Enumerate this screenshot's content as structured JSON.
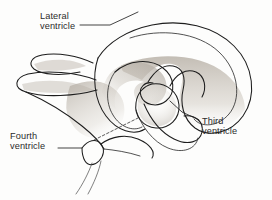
{
  "figure": {
    "background_color": "#fdfdfc",
    "ink_color": "#1d1d1d",
    "shading_color": "#9a948c",
    "labels": [
      {
        "id": "lateral-ventricle",
        "line1": "Lateral",
        "line2": "ventricle",
        "text_x": 40,
        "text_y": 19,
        "leader": "M 80 25 L 110 25 L 138 12"
      },
      {
        "id": "third-ventricle",
        "line1": "Third",
        "line2": "ventricle",
        "text_x": 202,
        "text_y": 124,
        "leader": "M 199 120 L 182 112 L 170 101"
      },
      {
        "id": "fourth-ventricle",
        "line1": "Fourth",
        "line2": "ventricle",
        "text_x": 10,
        "text_y": 139,
        "leader": "M 58 148 L 82 148"
      }
    ],
    "structures": [
      {
        "id": "lateral-ventricle-body",
        "name": "lateral ventricle body"
      },
      {
        "id": "anterior-horn-upper",
        "name": "upper anterior horn"
      },
      {
        "id": "anterior-horn-lower",
        "name": "lower anterior horn"
      },
      {
        "id": "third-ventricle-chamber",
        "name": "third ventricle chamber"
      },
      {
        "id": "inferior-horn",
        "name": "inferior temporal horn"
      },
      {
        "id": "fourth-ventricle-chamber",
        "name": "fourth ventricle chamber"
      },
      {
        "id": "cerebral-aqueduct",
        "name": "cerebral aqueduct (dashed)"
      },
      {
        "id": "central-canal",
        "name": "central canal"
      }
    ]
  }
}
